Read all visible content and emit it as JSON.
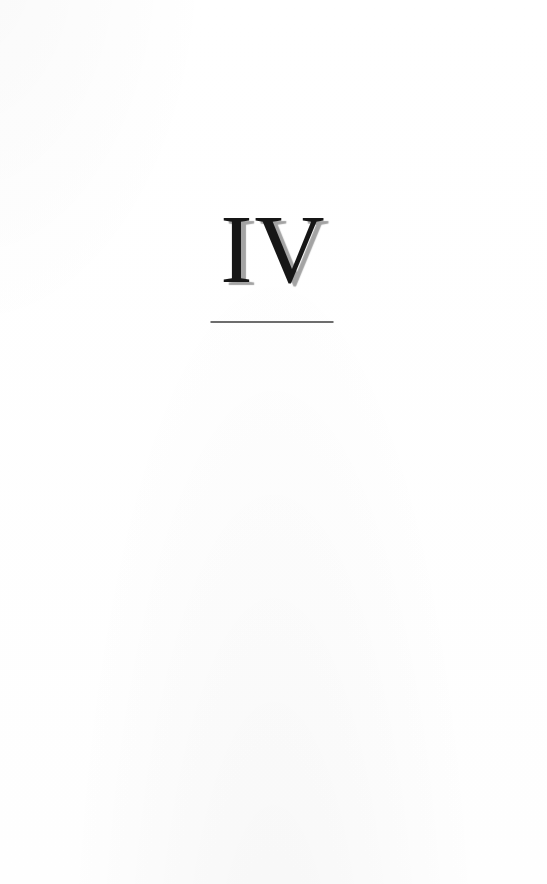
{
  "page": {
    "kind": "book-chapter-divider",
    "chapter_number": "IV",
    "colors": {
      "background": "#ffffff",
      "numeral": "#161616",
      "numeral_shadow": "#a3a3a3",
      "rule": "#6d6d6d"
    }
  }
}
